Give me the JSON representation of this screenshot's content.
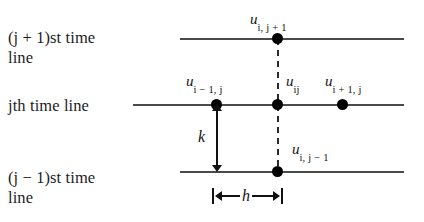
{
  "figure": {
    "background_color": "#ffffff",
    "line_color": "#4a4a4a",
    "node_color": "#000000",
    "dash_color": "#2a2a2a"
  },
  "row_labels": {
    "top": "(j + 1)st time\nline",
    "middle": "jth time line",
    "bottom": "(j − 1)st time\nline"
  },
  "nodes": {
    "top": {
      "base": "u",
      "subscript": "i, j + 1"
    },
    "left": {
      "base": "u",
      "subscript": "i − 1, j"
    },
    "center": {
      "base": "u",
      "subscript": "ij"
    },
    "right": {
      "base": "u",
      "subscript": "i + 1, j"
    },
    "bottom": {
      "base": "u",
      "subscript": "i, j − 1"
    }
  },
  "measures": {
    "vertical_label": "k",
    "horizontal_label": "h"
  },
  "chart_data": {
    "type": "scatter",
    "xlabel": "",
    "ylabel": "",
    "grid": false,
    "legend": null,
    "time_lines": [
      {
        "name": "(j + 1)st time line",
        "y_index": 1
      },
      {
        "name": "jth time line",
        "y_index": 0
      },
      {
        "name": "(j − 1)st time line",
        "y_index": -1
      }
    ],
    "points": [
      {
        "label": "u_{i, j + 1}",
        "x_index": 0,
        "y_index": 1
      },
      {
        "label": "u_{i - 1, j}",
        "x_index": -1,
        "y_index": 0
      },
      {
        "label": "u_{ij}",
        "x_index": 0,
        "y_index": 0
      },
      {
        "label": "u_{i + 1, j}",
        "x_index": 1,
        "y_index": 0
      },
      {
        "label": "u_{i, j - 1}",
        "x_index": 0,
        "y_index": -1
      }
    ],
    "spacings": [
      {
        "symbol": "k",
        "direction": "vertical",
        "between": [
          "jth time line",
          "(j − 1)st time line"
        ]
      },
      {
        "symbol": "h",
        "direction": "horizontal",
        "between": [
          "u_{i - 1, j}",
          "u_{ij}"
        ]
      }
    ]
  }
}
